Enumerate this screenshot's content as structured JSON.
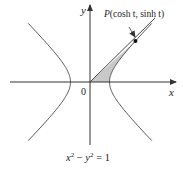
{
  "diagram": {
    "type": "hyperbola-parametric",
    "equation_label": {
      "base": "x",
      "exp1": "2",
      "minus": " − ",
      "base2": "y",
      "exp2": "2",
      "rhs": " = 1"
    },
    "axes": {
      "x_label": "x",
      "y_label": "y",
      "origin_label": "0"
    },
    "point": {
      "name": "P",
      "label": "P(cosh t, sinh t)",
      "prefix": "P(",
      "coords": "cosh t, sinh t",
      "suffix": ")"
    },
    "shaded_region": "area between segment OP, hyperbola right branch and x-axis",
    "colors": {
      "curve": "#555555",
      "axis": "#333333",
      "shade": "#c8c8c8",
      "point": "#111111"
    }
  }
}
